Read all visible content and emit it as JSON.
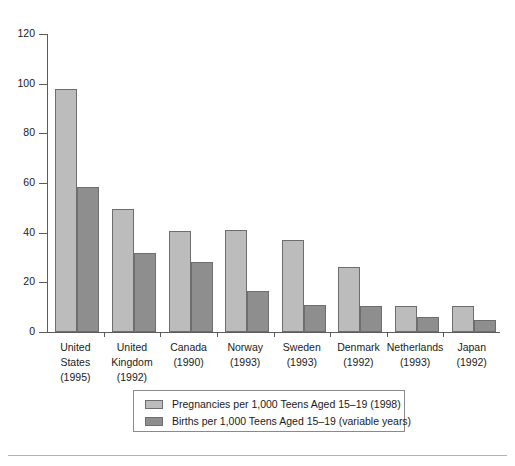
{
  "chart_data": {
    "type": "bar",
    "title": "",
    "xlabel": "",
    "ylabel": "",
    "ylim": [
      0,
      120
    ],
    "yticks": [
      0,
      20,
      40,
      60,
      80,
      100,
      120
    ],
    "grid": false,
    "legend_position": "bottom",
    "categories": [
      "United\nStates\n(1995)",
      "United\nKingdom\n(1992)",
      "Canada\n(1990)",
      "Norway\n(1993)",
      "Sweden\n(1993)",
      "Denmark\n(1992)",
      "Netherlands\n(1993)",
      "Japan\n(1992)"
    ],
    "category_rows": [
      [
        "United",
        "States",
        "(1995)"
      ],
      [
        "United",
        "Kingdom",
        "(1992)"
      ],
      [
        "Canada",
        "(1990)",
        ""
      ],
      [
        "Norway",
        "(1993)",
        ""
      ],
      [
        "Sweden",
        "(1993)",
        ""
      ],
      [
        "Denmark",
        "(1992)",
        ""
      ],
      [
        "Netherlands",
        "(1993)",
        ""
      ],
      [
        "Japan",
        "(1992)",
        ""
      ]
    ],
    "series": [
      {
        "name": "Pregnancies per 1,000 Teens Aged 15–19 (1998)",
        "color": "#bcbcbc",
        "values": [
          98,
          49.5,
          40.5,
          41,
          37,
          26,
          10.5,
          10.5
        ]
      },
      {
        "name": "Births per 1,000 Teens Aged 15–19 (variable years)",
        "color": "#8e8e8e",
        "values": [
          58.5,
          32,
          28,
          16.5,
          11,
          10.5,
          6,
          5
        ]
      }
    ]
  },
  "axis": {
    "ytick_labels": [
      "0",
      "20",
      "40",
      "60",
      "80",
      "100",
      "120"
    ]
  },
  "legend": {
    "items": [
      {
        "label": "Pregnancies per 1,000 Teens Aged 15–19 (1998)",
        "swatch": "light-gray-swatch"
      },
      {
        "label": "Births per 1,000 Teens Aged 15–19 (variable years)",
        "swatch": "dark-gray-swatch"
      }
    ]
  }
}
